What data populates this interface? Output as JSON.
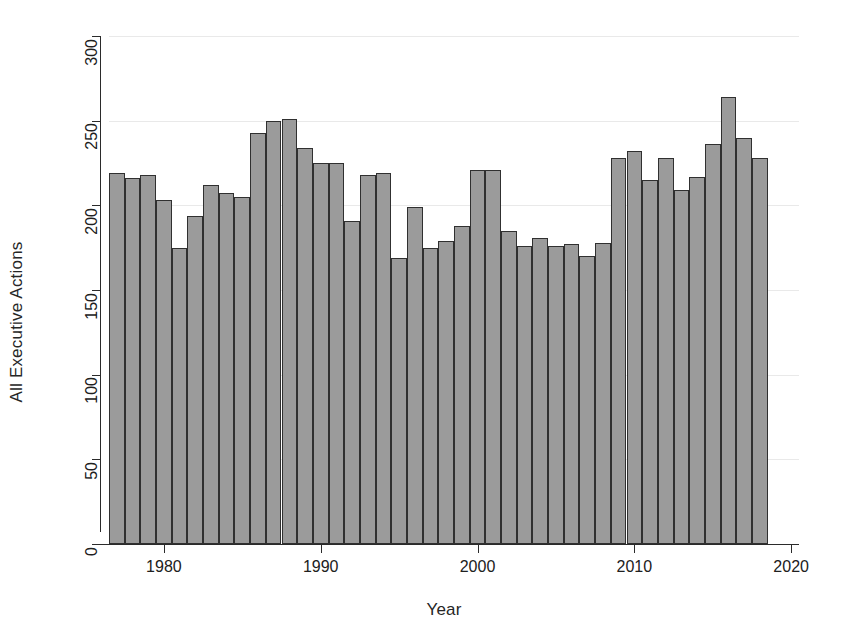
{
  "chart_data": {
    "type": "bar",
    "title": "",
    "xlabel": "Year",
    "ylabel": "All Executive Actions",
    "grid": true,
    "legend": null,
    "xlim": [
      1976.5,
      2020.5
    ],
    "ylim": [
      0,
      300
    ],
    "xticks": [
      1980,
      1990,
      2000,
      2010,
      2020
    ],
    "xtick_labels": [
      "1980",
      "1990",
      "2000",
      "2010",
      "2020"
    ],
    "yticks": [
      0,
      50,
      100,
      150,
      200,
      250,
      300
    ],
    "ytick_labels": [
      "0",
      "50",
      "100",
      "150",
      "200",
      "250",
      "300"
    ],
    "bar_color": "#9b9b9b",
    "bar_edge_color": "#303030",
    "categories": [
      1977,
      1978,
      1979,
      1980,
      1981,
      1982,
      1983,
      1984,
      1985,
      1986,
      1987,
      1988,
      1989,
      1990,
      1991,
      1992,
      1993,
      1994,
      1995,
      1996,
      1997,
      1998,
      1999,
      2000,
      2001,
      2002,
      2003,
      2004,
      2005,
      2006,
      2007,
      2008,
      2009,
      2010,
      2011,
      2012,
      2013,
      2014,
      2015,
      2016,
      2017,
      2018
    ],
    "values": [
      219,
      216,
      218,
      203,
      175,
      194,
      212,
      207,
      205,
      243,
      250,
      251,
      234,
      225,
      225,
      191,
      218,
      219,
      169,
      199,
      175,
      179,
      188,
      221,
      221,
      185,
      176,
      181,
      176,
      177,
      170,
      178,
      228,
      232,
      215,
      228,
      209,
      217,
      236,
      264,
      240,
      228
    ]
  }
}
